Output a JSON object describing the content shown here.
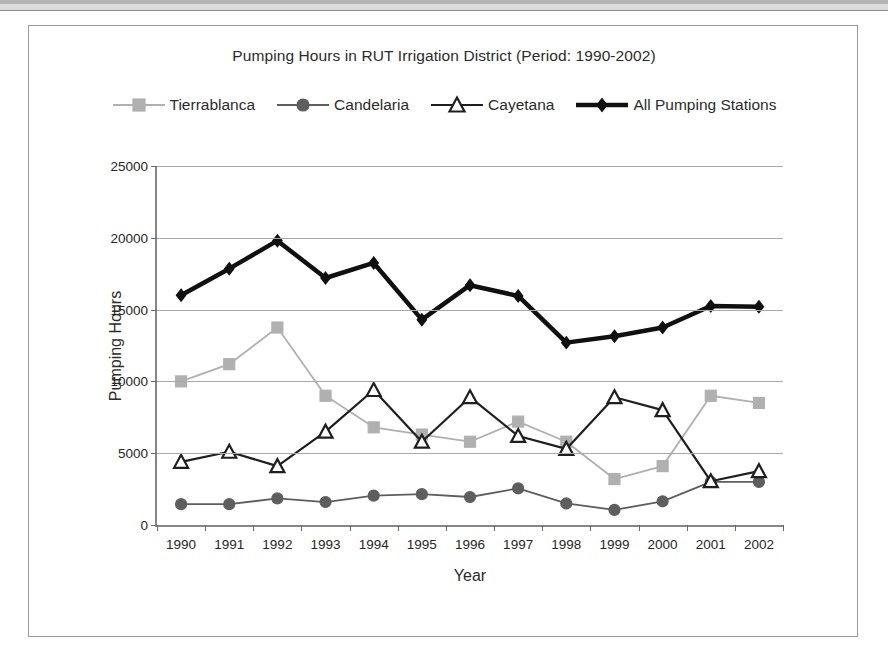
{
  "chart_data": {
    "type": "line",
    "title": "Pumping Hours in RUT Irrigation District (Period: 1990-2002)",
    "xlabel": "Year",
    "ylabel": "Pumping Hours",
    "categories": [
      "1990",
      "1991",
      "1992",
      "1993",
      "1994",
      "1995",
      "1996",
      "1997",
      "1998",
      "1999",
      "2000",
      "2001",
      "2002"
    ],
    "x": [
      1990,
      1991,
      1992,
      1993,
      1994,
      1995,
      1996,
      1997,
      1998,
      1999,
      2000,
      2001,
      2002
    ],
    "ylim": [
      0,
      25000
    ],
    "yticks": [
      0,
      5000,
      10000,
      15000,
      20000,
      25000
    ],
    "ytick_labels": [
      "0",
      "5000",
      "10000",
      "15000",
      "20000",
      "25000"
    ],
    "grid": true,
    "grid_axis": "y",
    "legend_position": "top",
    "series": [
      {
        "name": "Tierrablanca",
        "marker": "square",
        "color": "#b0b0b0",
        "marker_fill": "#b0b0b0",
        "marker_stroke": "#b0b0b0",
        "line_width": 1.8,
        "marker_size": 11,
        "values": [
          10000,
          11200,
          13750,
          9000,
          6800,
          6300,
          5800,
          7200,
          5800,
          3200,
          4100,
          9000,
          8500
        ]
      },
      {
        "name": "Candelaria",
        "marker": "circle",
        "color": "#5e5e5e",
        "marker_fill": "#5e5e5e",
        "marker_stroke": "#5e5e5e",
        "line_width": 1.8,
        "marker_size": 11,
        "values": [
          1450,
          1450,
          1850,
          1600,
          2050,
          2150,
          1950,
          2550,
          1500,
          1050,
          1650,
          3000,
          3000
        ]
      },
      {
        "name": "Cayetana",
        "marker": "triangle",
        "color": "#1f1f1f",
        "marker_fill": "#ffffff",
        "marker_stroke": "#1f1f1f",
        "line_width": 2.2,
        "marker_size": 12,
        "values": [
          4400,
          5100,
          4100,
          6500,
          9400,
          5800,
          8900,
          6200,
          5300,
          8900,
          8000,
          3050,
          3750
        ]
      },
      {
        "name": "All Pumping Stations",
        "marker": "diamond",
        "color": "#101010",
        "marker_fill": "#101010",
        "marker_stroke": "#101010",
        "line_width": 4.5,
        "marker_size": 12,
        "values": [
          16000,
          17850,
          19800,
          17200,
          18250,
          14300,
          16700,
          15950,
          12700,
          13150,
          13750,
          15250,
          15200
        ]
      }
    ]
  },
  "colors": {
    "axis": "#868686",
    "gridline": "#a8a8a8",
    "text": "#2b2b2b",
    "frame": "#9a9a9a",
    "background": "#ffffff"
  }
}
